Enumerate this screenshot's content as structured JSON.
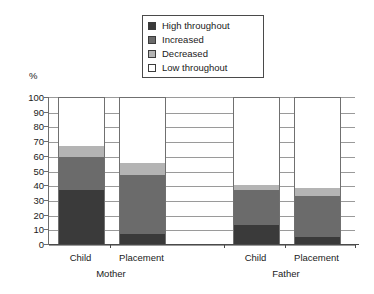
{
  "chart_data": {
    "type": "bar",
    "subtype": "stacked-bar",
    "title": "",
    "xlabel": "",
    "ylabel": "%",
    "ylim": [
      0,
      100
    ],
    "ytick_step": 10,
    "ytick_labels": [
      "100",
      "90",
      "80",
      "70",
      "60",
      "50",
      "40",
      "30",
      "20",
      "10",
      "0"
    ],
    "grid": true,
    "legend_position": "top-center",
    "categories": [
      "Child",
      "Placement",
      "Child",
      "Placement"
    ],
    "groups": [
      {
        "label": "Mother",
        "categories": [
          "Child",
          "Placement"
        ]
      },
      {
        "label": "Father",
        "categories": [
          "Child",
          "Placement"
        ]
      }
    ],
    "series": [
      {
        "name": "High throughout",
        "color": "#3a3a3a",
        "values": [
          37,
          7,
          13,
          5
        ]
      },
      {
        "name": "Increased",
        "color": "#6b6b6b",
        "values": [
          22,
          40,
          24,
          28
        ]
      },
      {
        "name": "Decreased",
        "color": "#b4b4b4",
        "values": [
          8,
          8,
          3,
          5
        ]
      },
      {
        "name": "Low throughout",
        "color": "#ffffff",
        "values": [
          33,
          45,
          60,
          62
        ]
      }
    ],
    "cumulative_tops": [
      [
        37,
        59,
        67,
        100
      ],
      [
        7,
        47,
        55,
        100
      ],
      [
        13,
        37,
        40,
        100
      ],
      [
        5,
        33,
        38,
        100
      ]
    ]
  },
  "legend": {
    "items": [
      {
        "label": "High throughout",
        "color": "#3a3a3a"
      },
      {
        "label": "Increased",
        "color": "#6b6b6b"
      },
      {
        "label": "Decreased",
        "color": "#b4b4b4"
      },
      {
        "label": "Low throughout",
        "color": "#ffffff"
      }
    ]
  },
  "axis": {
    "unit_label": "%",
    "y_ticks": [
      "100",
      "90",
      "80",
      "70",
      "60",
      "50",
      "40",
      "30",
      "20",
      "10",
      "0"
    ]
  },
  "x_axis": {
    "tick_labels": [
      "Child",
      "Placement",
      "Child",
      "Placement"
    ],
    "group_labels": [
      "Mother",
      "Father"
    ]
  }
}
